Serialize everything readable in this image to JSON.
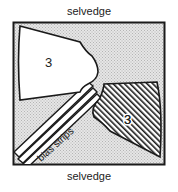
{
  "diagram": {
    "top_label": "selvedge",
    "bottom_label": "selvedge",
    "pieces": [
      {
        "id": "piece-plain",
        "label": "3",
        "fill": "none"
      },
      {
        "id": "piece-hatched",
        "label": "3",
        "fill": "hatched"
      }
    ],
    "bias_label": "bias strips"
  },
  "colors": {
    "fabric": "#d8d8d8",
    "outline": "#1a1a1a",
    "piece": "#ffffff"
  }
}
